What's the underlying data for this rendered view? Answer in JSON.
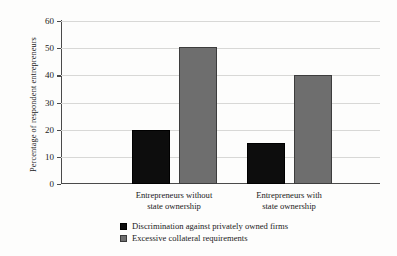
{
  "chart_data": {
    "type": "bar",
    "title": "",
    "xlabel": "",
    "ylabel": "Percentage of respondent entrepreneurs",
    "ylim": [
      0,
      60
    ],
    "yticks": [
      0,
      10,
      20,
      30,
      40,
      50,
      60
    ],
    "ytick_labels": [
      "0",
      "10",
      "20",
      "30",
      "40",
      "50",
      "60"
    ],
    "grid": true,
    "legend_position": "bottom-left",
    "categories": [
      "Entrepreneurs without state ownership",
      "Entrepreneurs with state ownership"
    ],
    "category_lines": [
      [
        "Entrepreneurs without",
        "state ownership"
      ],
      [
        "Entrepreneurs with",
        "state ownership"
      ]
    ],
    "series": [
      {
        "name": "Discrimination against privately owned firms",
        "color": "#0d0d0d",
        "values": [
          20,
          15
        ]
      },
      {
        "name": "Excessive collateral requirements",
        "color": "#6e6e6e",
        "values": [
          50.5,
          40
        ]
      }
    ]
  }
}
